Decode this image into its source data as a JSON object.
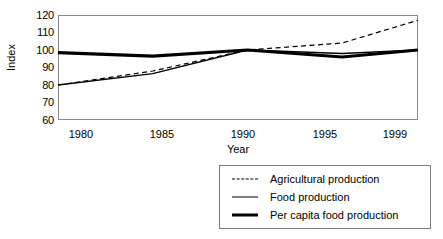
{
  "chart_data": {
    "type": "line",
    "title": "",
    "xlabel": "Year",
    "ylabel": "Index",
    "categories": [
      "1980",
      "1985",
      "1990",
      "1995",
      "1999"
    ],
    "x": [
      1980,
      1985,
      1990,
      1995,
      1999
    ],
    "xlim": [
      1980,
      1999
    ],
    "ylim": [
      60,
      120
    ],
    "yticks": [
      60,
      70,
      80,
      90,
      100,
      110,
      120
    ],
    "ytick_labels": [
      "60",
      "70",
      "80",
      "90",
      "100",
      "110",
      "120"
    ],
    "grid": false,
    "legend_position": "below-right",
    "series": [
      {
        "name": "Agricultural production",
        "style": "dashed",
        "width": 1.2,
        "color": "#000000",
        "values": [
          80,
          88,
          100,
          104,
          117
        ]
      },
      {
        "name": "Food production",
        "style": "solid",
        "width": 1.4,
        "color": "#000000",
        "values": [
          80,
          86.5,
          100,
          98,
          100
        ]
      },
      {
        "name": "Per capita food production",
        "style": "solid",
        "width": 3.2,
        "color": "#000000",
        "values": [
          98.5,
          96.5,
          100,
          96,
          100
        ]
      }
    ]
  },
  "axes": {
    "y_title": "Index",
    "x_title": "Year",
    "y_ticks": [
      "120",
      "110",
      "100",
      "90",
      "80",
      "70",
      "60"
    ],
    "x_ticks": [
      "1980",
      "1985",
      "1990",
      "1995",
      "1999"
    ]
  },
  "legend": {
    "entries": [
      {
        "label": "Agricultural production",
        "swatch": "dashed-line-icon"
      },
      {
        "label": "Food production",
        "swatch": "thin-line-icon"
      },
      {
        "label": "Per capita food production",
        "swatch": "thick-line-icon"
      }
    ]
  },
  "colors": {
    "line": "#000000",
    "frame": "#8a8a8a",
    "background": "#ffffff"
  }
}
